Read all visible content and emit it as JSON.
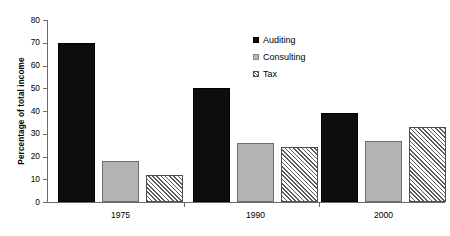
{
  "chart_data": {
    "type": "bar",
    "title": "",
    "subtitle": "",
    "xlabel": "",
    "ylabel": "Percentage of total income",
    "categories": [
      "1975",
      "1990",
      "2000"
    ],
    "series": [
      {
        "name": "Auditing",
        "values": [
          70,
          50,
          39
        ]
      },
      {
        "name": "Consulting",
        "values": [
          18,
          26,
          27
        ]
      },
      {
        "name": "Tax",
        "values": [
          12,
          24,
          33
        ]
      }
    ],
    "ylim": [
      0,
      80
    ],
    "ytick_values": [
      0,
      10,
      20,
      30,
      40,
      50,
      60,
      70,
      80
    ],
    "ytick_labels": [
      "0",
      "10",
      "20",
      "30",
      "40",
      "50",
      "60",
      "70",
      "80"
    ],
    "grid": false,
    "legend_position": "top-right",
    "colors": {
      "auditing": "#0d0d0d",
      "consulting": "#b4b4b4",
      "tax_hatch": "#5a5a5a",
      "tax_background": "#ffffff",
      "axis": "#6b6b6b",
      "text": "#000000",
      "plot_background": "#ffffff"
    }
  },
  "legend": {
    "items": [
      {
        "label": "Auditing",
        "swatch": "black-square-icon"
      },
      {
        "label": "Consulting",
        "swatch": "gray-square-icon"
      },
      {
        "label": "Tax",
        "swatch": "hatched-square-icon"
      }
    ]
  }
}
